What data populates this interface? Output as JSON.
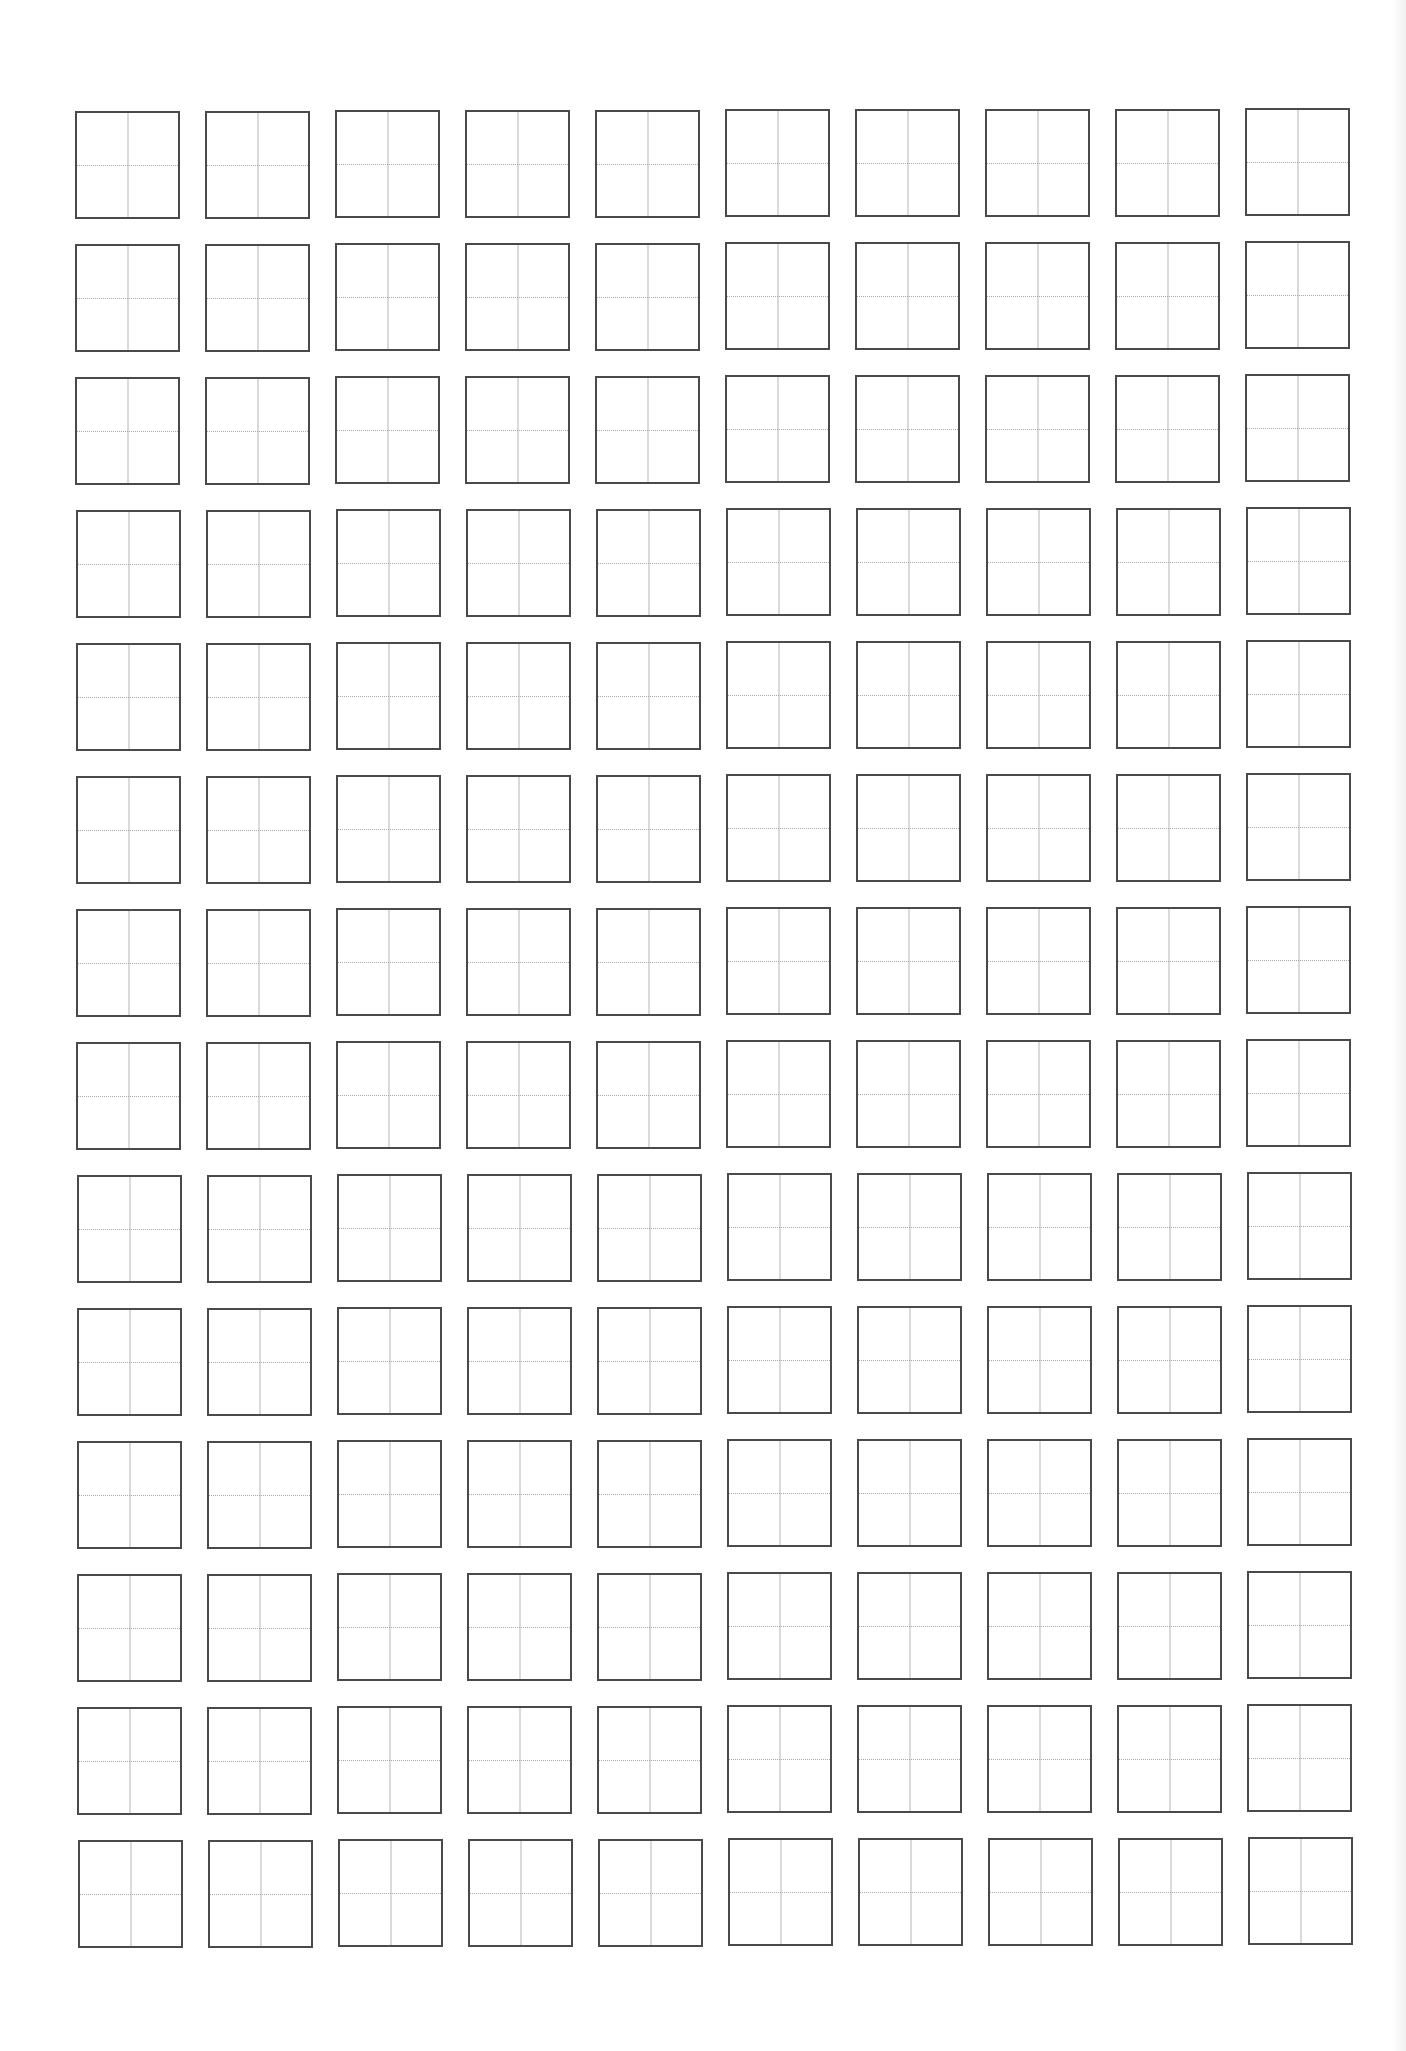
{
  "worksheet": {
    "type": "tian-zi-ge practice grid",
    "rows": 14,
    "columns": 10,
    "cell": {
      "width": 105,
      "height": 108,
      "border_color": "#4a4a4a",
      "guide_color": "#b0b0b0",
      "guides": [
        "vertical-center-line",
        "horizontal-center-line"
      ]
    },
    "layout": {
      "first_cell_left": 75,
      "first_cell_top": 111,
      "column_pitch": 130,
      "row_pitch": 133
    },
    "background_color": "#ffffff"
  }
}
